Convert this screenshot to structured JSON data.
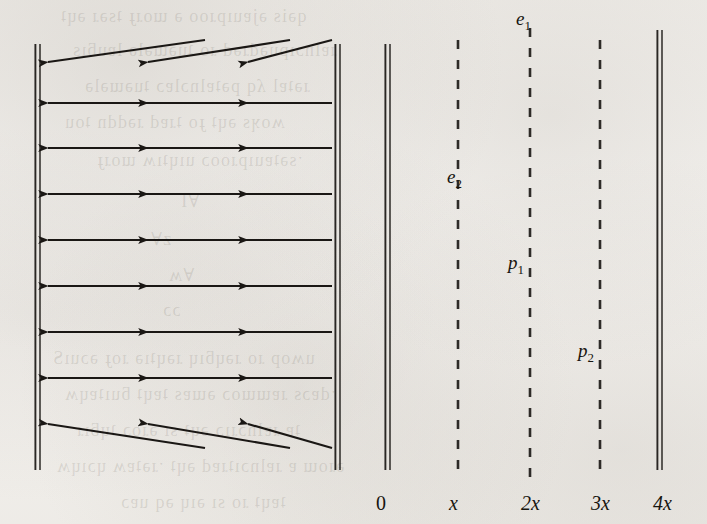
{
  "figure": {
    "kind": "vector-field-diagram",
    "background_color": "#f4f2ef",
    "ink_color": "#1a1714",
    "width": 707,
    "height": 524
  },
  "axis": {
    "name": "horizontal-position-axis",
    "ticks": [
      {
        "label": "0",
        "x": 385,
        "italic": false
      },
      {
        "label": "x",
        "x": 458,
        "italic": true
      },
      {
        "label": "2x",
        "x": 530,
        "italic": true
      },
      {
        "label": "3x",
        "x": 600,
        "italic": true
      },
      {
        "label": "4x",
        "x": 662,
        "italic": true
      }
    ],
    "baseline_y": 492
  },
  "solid_walls": [
    {
      "name": "wall-left",
      "x": 38,
      "y1": 44,
      "y2": 470
    },
    {
      "name": "wall-inner-left",
      "x": 338,
      "y1": 44,
      "y2": 470
    },
    {
      "name": "wall-zero",
      "x": 388,
      "y1": 44,
      "y2": 470
    },
    {
      "name": "wall-right",
      "x": 660,
      "y1": 30,
      "y2": 470
    }
  ],
  "dashed_lines": [
    {
      "name": "dashed-line-x",
      "x": 458,
      "y1": 40,
      "y2": 480
    },
    {
      "name": "dashed-line-2x",
      "x": 530,
      "y1": 28,
      "y2": 480
    },
    {
      "name": "dashed-line-3x",
      "x": 600,
      "y1": 40,
      "y2": 480
    }
  ],
  "field_labels": [
    {
      "name": "label-e1",
      "base": "e",
      "sub": "1",
      "x": 516,
      "y": 8
    },
    {
      "name": "label-e2",
      "base": "e",
      "sub": "2",
      "x": 447,
      "y": 166
    },
    {
      "name": "label-p1",
      "base": "p",
      "sub": "1",
      "x": 508,
      "y": 252
    },
    {
      "name": "label-p2",
      "base": "p",
      "sub": "2",
      "x": 578,
      "y": 340
    }
  ],
  "arrow_rows": [
    {
      "name": "arrow-row-1",
      "tip_y": 62,
      "tail_y": 40,
      "slanted": true
    },
    {
      "name": "arrow-row-2",
      "tip_y": 103,
      "tail_y": 103,
      "slanted": false
    },
    {
      "name": "arrow-row-3",
      "tip_y": 148,
      "tail_y": 148,
      "slanted": false
    },
    {
      "name": "arrow-row-4",
      "tip_y": 194,
      "tail_y": 194,
      "slanted": false
    },
    {
      "name": "arrow-row-5",
      "tip_y": 240,
      "tail_y": 240,
      "slanted": false
    },
    {
      "name": "arrow-row-6",
      "tip_y": 286,
      "tail_y": 286,
      "slanted": false
    },
    {
      "name": "arrow-row-7",
      "tip_y": 332,
      "tail_y": 332,
      "slanted": false
    },
    {
      "name": "arrow-row-8",
      "tip_y": 378,
      "tail_y": 378,
      "slanted": false
    },
    {
      "name": "arrow-row-9",
      "tip_y": 424,
      "tail_y": 448,
      "slanted": true
    }
  ],
  "arrow_columns": [
    {
      "name": "arrow-col-1",
      "tip_x": 48,
      "tail_x": 205
    },
    {
      "name": "arrow-col-2",
      "tip_x": 148,
      "tail_x": 290
    },
    {
      "name": "arrow-col-3",
      "tip_x": 248,
      "tail_x": 332
    }
  ],
  "ghost_text_rows": [
    {
      "text": "qəis əjɐuıpɹoo ə ɯoɹɟ ʇsəɹ əɥʇ",
      "x": 60,
      "y": 6,
      "size": 18
    },
    {
      "text": "ɹɐlnɔıpuədɹəd ɹo ʇuəɯələ lɐuƃıs",
      "x": 72,
      "y": 40,
      "size": 18
    },
    {
      "text": "ɹəʇɐl ʎq pəʇɐlnɔlɐɔ ʇuəɯələ",
      "x": 84,
      "y": 76,
      "size": 18
    },
    {
      "text": "ʍoʞs əɥʇ ɟo ʇɹɐd ɹəddn ʇou",
      "x": 64,
      "y": 112,
      "size": 18
    },
    {
      "text": "ˑsəʇɐuıpɹooɔ uıɥʇıʍ ɯoɹɟ",
      "x": 96,
      "y": 150,
      "size": 18
    },
    {
      "text": "∀I",
      "x": 180,
      "y": 190,
      "size": 18
    },
    {
      "text": "z∀",
      "x": 150,
      "y": 228,
      "size": 18
    },
    {
      "text": "∀ʍ",
      "x": 168,
      "y": 264,
      "size": 18
    },
    {
      "text": "ɔɔ",
      "x": 162,
      "y": 300,
      "size": 18
    },
    {
      "text": "uʍop ɹo ɹəɥƃıɥ ɹəɥʇıə ɹoɟ əɔuıS",
      "x": 52,
      "y": 348,
      "size": 18
    },
    {
      "text": "ˑdɐɔs ɹɐɯɯoɔ əɯɐs ʇɐɥʇ ƃuıʇɐɥʍ",
      "x": 64,
      "y": 384,
      "size": 18
    },
    {
      "text": "ʇɐ ɹɐlnɔɹıɔ əɥʇ sı əɹoɔ ʇɥƃıɹ",
      "x": 76,
      "y": 420,
      "size": 18
    },
    {
      "text": "əɹoɯ ɐ ɹɐlnɔıʇɹɐd əɥʇ ˑɹəʇɐʍ ɥɔıɥʍ",
      "x": 56,
      "y": 456,
      "size": 18
    },
    {
      "text": "ʇɐɥʇ ɹo sı ǝıɥ ǝq uɐɔ",
      "x": 120,
      "y": 492,
      "size": 18
    }
  ]
}
